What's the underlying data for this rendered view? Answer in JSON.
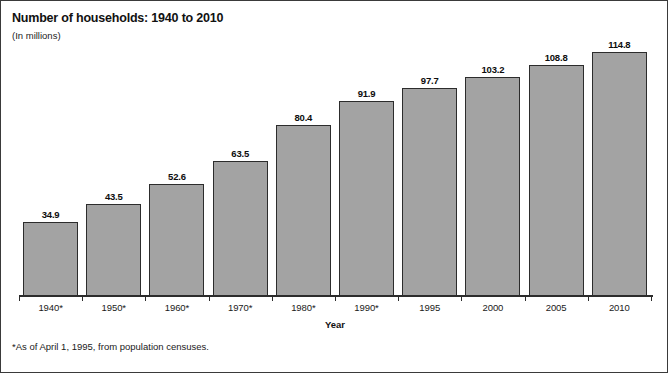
{
  "chart": {
    "title": "Number of households: 1940 to 2010",
    "subtitle": "(In millions)",
    "xlabel": "Year",
    "footnote": "*As of April 1, 1995, from population censuses."
  },
  "chart_data": {
    "type": "bar",
    "title": "Number of households: 1940 to 2010",
    "subtitle": "(In millions)",
    "xlabel": "Year",
    "ylabel": "",
    "units": "millions",
    "grid": false,
    "legend": null,
    "ylim": [
      0,
      120
    ],
    "axis_visible": {
      "x": true,
      "y": false
    },
    "bar_color": "#a3a3a3",
    "bar_edge_color": "#2c2c2c",
    "categories": [
      "1940*",
      "1950*",
      "1960*",
      "1970*",
      "1980*",
      "1990*",
      "1995",
      "2000",
      "2005",
      "2010"
    ],
    "values": [
      34.9,
      43.5,
      52.6,
      63.5,
      80.4,
      91.9,
      97.7,
      103.2,
      108.8,
      114.8
    ],
    "data_labels": [
      "34.9",
      "43.5",
      "52.6",
      "63.5",
      "80.4",
      "91.9",
      "97.7",
      "103.2",
      "108.8",
      "114.8"
    ],
    "annotations": [
      "*As of April 1, 1995, from population censuses."
    ]
  }
}
